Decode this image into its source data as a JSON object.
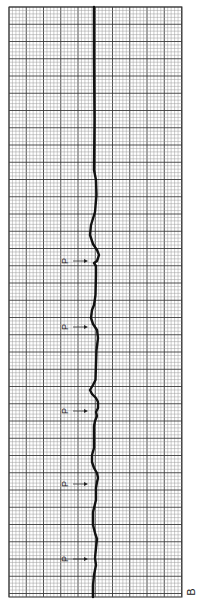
{
  "figure": {
    "panel_label": "B",
    "orientation": "rotated-90",
    "grid_color_minor": "#9a9a9a",
    "grid_color_major": "#3a3a3a",
    "trace_color": "#111111",
    "markers": [
      {
        "label": "P"
      },
      {
        "label": "P"
      },
      {
        "label": "P"
      },
      {
        "label": "P"
      },
      {
        "label": "P"
      }
    ]
  }
}
